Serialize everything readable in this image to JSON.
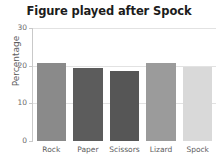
{
  "chart_data": {
    "type": "bar",
    "title": "Figure played after Spock",
    "xlabel": "",
    "ylabel": "Percentage",
    "categories": [
      "Rock",
      "Paper",
      "Scissors",
      "Lizard",
      "Spock"
    ],
    "values": [
      20.8,
      19.3,
      18.5,
      20.8,
      19.6
    ],
    "bar_colors": [
      "#8a8a8a",
      "#5c5c5c",
      "#565656",
      "#9b9b9b",
      "#d9d9d9"
    ],
    "ylim": [
      0,
      30
    ],
    "yticks": [
      0,
      10,
      20,
      30
    ],
    "ytick_labels": [
      "0",
      "10",
      "20",
      "30"
    ],
    "grid": true,
    "grid_color": "#e2e2e2",
    "legend": false,
    "legend_position": "none",
    "axis_color": "#c9c9c9",
    "title_color": "#1c1c1c",
    "tick_label_color": "#6b6b6b"
  }
}
